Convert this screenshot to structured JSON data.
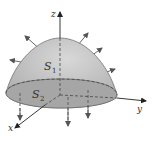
{
  "diagram": {
    "type": "3d-surface-flux",
    "axes": {
      "x_label": "x",
      "y_label": "y",
      "z_label": "z"
    },
    "surfaces": [
      {
        "name": "S",
        "subscript": "1",
        "role": "paraboloid-cap",
        "normal_direction": "outward-up"
      },
      {
        "name": "S",
        "subscript": "2",
        "role": "base-disk",
        "normal_direction": "downward"
      }
    ],
    "colors": {
      "surface_fill": "#b8b8b8",
      "surface_light": "#dcdcdc",
      "base_fill": "#a8a8a8",
      "stroke": "#555555",
      "axis": "#444444",
      "background": "#ffffff"
    }
  }
}
